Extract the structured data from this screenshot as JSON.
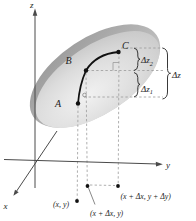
{
  "figure": {
    "axes": {
      "x_label": "x",
      "y_label": "y",
      "z_label": "z"
    },
    "surface_points": {
      "a": "A",
      "b": "B",
      "c": "C"
    },
    "increment_labels": {
      "dz2_main": "Δz",
      "dz2_sub": "2",
      "dz1_main": "Δz",
      "dz1_sub": "1",
      "dz_total": "Δz"
    },
    "plane_point_labels": {
      "xy": "(x, y)",
      "xdx_y": "(x + Δx, y)",
      "xdx_ydy": "(x + Δx, y + Δy)"
    },
    "colors": {
      "surface_rim_dark": "#999999",
      "surface_rim_light": "#c2c2c2",
      "surface_face_highlight": "#f1f1f1",
      "surface_face_mid": "#dcdcdc",
      "surface_face_edge": "#bcbcbc",
      "axis": "#4a4a4a",
      "dashed_line": "#9b9b9b",
      "ink": "#1c1c1c"
    }
  }
}
